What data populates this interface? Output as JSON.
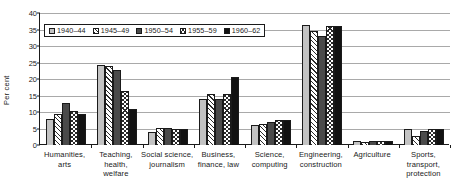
{
  "chart_data": {
    "type": "bar",
    "title": "",
    "subtitle": "",
    "xlabel": "",
    "ylabel": "Per cent",
    "ylim": [
      0,
      40
    ],
    "ytick_step": 5,
    "yticks": [
      0,
      5,
      10,
      15,
      20,
      25,
      30,
      35,
      40
    ],
    "grid": true,
    "grid_axis": "y",
    "legend_position": "top-left inside plot",
    "categories": [
      "Humanities, arts",
      "Teaching, health, welfare",
      "Social science, journalism",
      "Business, finance, law",
      "Science, computing",
      "Engineering, construction",
      "Agriculture",
      "Sports, transport, protection"
    ],
    "category_lines": [
      [
        "Humanities,",
        "arts"
      ],
      [
        "Teaching,",
        "health,",
        "welfare"
      ],
      [
        "Social science,",
        "journalism"
      ],
      [
        "Business,",
        "finance, law"
      ],
      [
        "Science,",
        "computing"
      ],
      [
        "Engineering,",
        "construction"
      ],
      [
        "Agriculture"
      ],
      [
        "Sports,",
        "transport,",
        "protection"
      ]
    ],
    "series": [
      {
        "name": "1940–44",
        "fill": "light-grey-solid",
        "color": "#c3c3c3",
        "values": [
          8.0,
          24.2,
          3.9,
          14.0,
          6.2,
          36.4,
          1.2,
          4.8
        ]
      },
      {
        "name": "1945–49",
        "fill": "white-diagonal-hatch",
        "color": "#ffffff",
        "values": [
          9.3,
          24.0,
          5.2,
          15.6,
          6.4,
          34.6,
          1.0,
          2.6
        ]
      },
      {
        "name": "1950–54",
        "fill": "dark-grey-solid",
        "color": "#4a4a4a",
        "values": [
          12.7,
          22.6,
          5.3,
          13.9,
          7.0,
          32.9,
          1.1,
          4.2
        ]
      },
      {
        "name": "1955–59",
        "fill": "white-crosshatch",
        "color": "#ffffff",
        "values": [
          10.2,
          16.5,
          4.8,
          15.5,
          7.5,
          36.1,
          1.1,
          4.9
        ]
      },
      {
        "name": "1960–62",
        "fill": "black-solid",
        "color": "#121212",
        "values": [
          9.4,
          11.0,
          4.9,
          20.5,
          7.7,
          36.2,
          1.2,
          4.8
        ]
      }
    ]
  }
}
